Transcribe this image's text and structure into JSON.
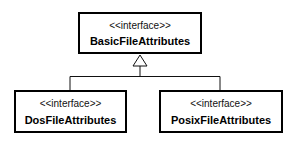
{
  "diagram": {
    "type": "uml-class-diagram",
    "nodes": [
      {
        "id": "basic",
        "stereotype": "<<interface>>",
        "name": "BasicFileAttributes"
      },
      {
        "id": "dos",
        "stereotype": "<<interface>>",
        "name": "DosFileAttributes"
      },
      {
        "id": "posix",
        "stereotype": "<<interface>>",
        "name": "PosixFileAttributes"
      }
    ],
    "edges": [
      {
        "from": "dos",
        "to": "basic",
        "kind": "generalization"
      },
      {
        "from": "posix",
        "to": "basic",
        "kind": "generalization"
      }
    ]
  }
}
